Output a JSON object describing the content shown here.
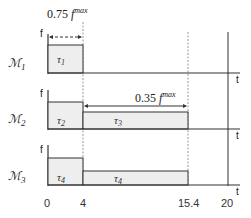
{
  "diagram": {
    "annotations": {
      "top_label_coef": "0.75",
      "top_label_var": "f",
      "top_label_sup": "max",
      "mid_label_coef": "0.35",
      "mid_label_var": "f",
      "mid_label_sup": "max"
    },
    "machines": [
      {
        "label": "ℳ",
        "sub": "1",
        "axis_y": "f",
        "axis_x": "t",
        "tasks": [
          {
            "label": "τ",
            "sub": "1"
          }
        ]
      },
      {
        "label": "ℳ",
        "sub": "2",
        "axis_y": "f",
        "axis_x": "t",
        "tasks": [
          {
            "label": "τ",
            "sub": "2"
          },
          {
            "label": "τ",
            "sub": "3"
          }
        ]
      },
      {
        "label": "ℳ",
        "sub": "3",
        "axis_y": "f",
        "axis_x": "t",
        "tasks": [
          {
            "label": "τ",
            "sub": "4"
          },
          {
            "label": "τ",
            "sub": "4"
          }
        ]
      }
    ],
    "time_ticks": [
      "0",
      "4",
      "15.4",
      "20"
    ],
    "colors": {
      "fill": "#eeeeee",
      "stroke": "#333333",
      "dashed": "#888888"
    }
  }
}
